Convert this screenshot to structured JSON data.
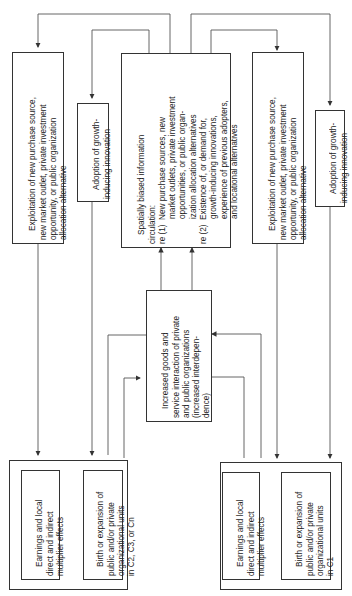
{
  "diagram": {
    "orientation": "rotated-90-ccw",
    "nodes": {
      "exploitation_left": {
        "lines": [
          "Exploitation of new purchase source,",
          "new market outlet, private investment",
          "opportunity, or public organization",
          "allocation alternative"
        ]
      },
      "adoption_left": {
        "lines": [
          "Adoption of growth-",
          "inducing innovation"
        ]
      },
      "spatial_info": {
        "lines": [
          "Spatially biased information",
          "circulation:",
          "re (1)  New purchase sources, new",
          "           market outlets, private investment",
          "           opportunities, or public organ-",
          "           ization allocation alternatives",
          "re (2)  Existence of, or demand for,",
          "           growth-inducing innovations,",
          "           experience of previous adopters,",
          "           and locational alternatives"
        ]
      },
      "exploitation_right": {
        "lines": [
          "Exploitation of new purchase source,",
          "new market outlet, private investment",
          "opportunity, or public organization",
          "allocation alternative"
        ]
      },
      "adoption_right": {
        "lines": [
          "Adoption of growth-",
          "inducing innovation"
        ]
      },
      "interaction": {
        "lines": [
          "Increased goods and",
          "service interaction of private",
          "and public organizations",
          "(increased interdepen-",
          "dence)"
        ]
      },
      "earnings_left": {
        "lines": [
          "Earnings and local",
          "direct and indirect",
          "multiplier effects"
        ]
      },
      "birth_left": {
        "lines": [
          "Birth or expansion of",
          "public and/or private",
          "organizational units",
          "in C2, C3, or Cn"
        ]
      },
      "earnings_right": {
        "lines": [
          "Earnings and local",
          "direct and indirect",
          "multiplier effects"
        ]
      },
      "birth_right": {
        "lines": [
          "Birth or expansion of",
          "public and/or private",
          "organizational units",
          "in C1"
        ]
      }
    }
  }
}
